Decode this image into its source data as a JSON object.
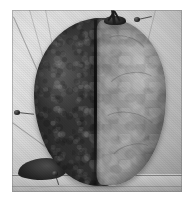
{
  "image": {
    "kind": "photograph",
    "subject": "bisected-organ-specimen",
    "color_mode": "grayscale",
    "alt_text": "Black and white photograph of a bisected organ specimen resting on a pale cloth-covered surface; the left half is dark and coarsely granular, the right half is pale grey and smoothly lobulated, with a deep vertical fissure separating them and a short dark branching stalk at the top.",
    "width_px": 195,
    "height_px": 205
  },
  "plate": {
    "name": "specimen-photograph",
    "left_px": 12,
    "top_px": 10,
    "width_px": 170,
    "height_px": 182,
    "margin_color": "#ffffff",
    "background_color": "#c8c8c8"
  },
  "regions": {
    "backdrop": {
      "label": "cloth-backdrop",
      "tone_hex": "#cdcdcd",
      "description": "light grey cloth or paper sheet with faint weave texture"
    },
    "left_lobe": {
      "label": "dark-lobe",
      "tone_hex": "#3a3a3a",
      "texture": "coarse granular mottling",
      "description": "dark, congested-looking half occupying the left portion of the specimen"
    },
    "right_lobe": {
      "label": "pale-lobe",
      "tone_hex": "#8e8e8e",
      "texture": "smooth lobulated mottling",
      "description": "pale grey half with soft surface creases on the right portion of the specimen"
    },
    "fissure": {
      "label": "median-fissure",
      "tone_hex": "#141414",
      "description": "deep vertical cleft running top to bottom between the two halves"
    },
    "stalk": {
      "label": "hilar-stalk",
      "tone_hex": "#1e1e1e",
      "description": "short dark branching stub projecting from the upper margin"
    },
    "surface_edge": {
      "label": "table-edge",
      "tone_hex": "#4a4a4a",
      "description": "horizontal line of the supporting surface near the lower border"
    }
  },
  "markers": [
    {
      "name": "pin-upper-right",
      "x_pct": 86,
      "y_pct": 6
    },
    {
      "name": "pin-left-mid",
      "x_pct": 4,
      "y_pct": 56
    },
    {
      "name": "pin-lower-left",
      "x_pct": 26,
      "y_pct": 92
    }
  ],
  "threads": [
    {
      "name": "thread-upper-left-a",
      "x_pct": 10,
      "y_pct": 0,
      "angle_deg": 74,
      "length_px": 120
    },
    {
      "name": "thread-upper-left-b",
      "x_pct": 19,
      "y_pct": 0,
      "angle_deg": 79,
      "length_px": 108
    },
    {
      "name": "thread-upper-left-c",
      "x_pct": 1,
      "y_pct": 4,
      "angle_deg": 66,
      "length_px": 128
    },
    {
      "name": "thread-upper-right",
      "x_pct": 84,
      "y_pct": 0,
      "angle_deg": 104,
      "length_px": 70
    },
    {
      "name": "thread-lower-left",
      "x_pct": 0,
      "y_pct": 62,
      "angle_deg": 36,
      "length_px": 52
    },
    {
      "name": "thread-lower-right",
      "x_pct": 58,
      "y_pct": 93,
      "angle_deg": 6,
      "length_px": 78
    }
  ]
}
